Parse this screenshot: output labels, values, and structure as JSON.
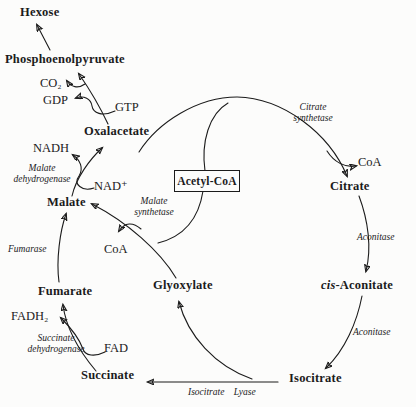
{
  "colors": {
    "background": "#fcfcfb",
    "ink": "#1b1b1b"
  },
  "metabolites": {
    "hexose": "Hexose",
    "phosphoenolpyruvate": "Phosphoenolpyruvate",
    "oxalacetate": "Oxalacetate",
    "malate": "Malate",
    "fumarate": "Fumarate",
    "succinate": "Succinate",
    "glyoxylate": "Glyoxylate",
    "isocitrate": "Isocitrate",
    "cis_aconitate_prefix": "cis",
    "cis_aconitate_suffix": "-Aconitate",
    "citrate": "Citrate",
    "acetyl_coa": "Acetyl-CoA"
  },
  "cofactors": {
    "co2": "CO₂",
    "gdp": "GDP",
    "gtp": "GTP",
    "nadh": "NADH",
    "nad_plus": "NAD⁺",
    "coa_malate_synthetase": "CoA",
    "fadh2": "FADH₂",
    "fad": "FAD",
    "coa_citrate_synthetase": "CoA"
  },
  "enzymes": {
    "citrate_synthetase": "Citrate\nsynthetase",
    "aconitase_upper": "Aconitase",
    "aconitase_lower": "Aconitase",
    "isocitrate_lyase": "Isocitrate Lyase",
    "malate_synthetase": "Malate\nsynthetase",
    "malate_dehydrogenase": "Malate\ndehydrogenase",
    "fumarase": "Fumarase",
    "succinate_dehydrogenase": "Succinate\ndehydrogenase"
  }
}
